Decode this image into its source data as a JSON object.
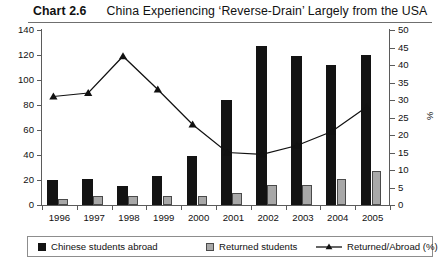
{
  "title": {
    "label": "Chart 2.6",
    "text": "China Experiencing ‘Reverse-Drain’ Largely from the USA"
  },
  "axes": {
    "y_left_ticks": [
      "0",
      "20",
      "40",
      "60",
      "80",
      "100",
      "120",
      "140"
    ],
    "y_right_ticks": [
      "0",
      "5",
      "10",
      "15",
      "20",
      "25",
      "30",
      "35",
      "40",
      "45",
      "50"
    ],
    "y_right_title": "%"
  },
  "legend": {
    "items": [
      {
        "label": "Chinese students abroad",
        "marker": "filled-square-dark",
        "color": "#131313"
      },
      {
        "label": "Returned students",
        "marker": "filled-square-grey",
        "color": "#a8a8a8"
      },
      {
        "label": "Returned/Abroad (%)",
        "marker": "line-with-triangle",
        "color": "#111111"
      }
    ]
  },
  "chart_data": {
    "type": "bar",
    "title": "China Experiencing ‘Reverse-Drain’ Largely from the USA",
    "xlabel": "",
    "ylabel": "",
    "y2label": "%",
    "ylim": [
      0,
      140
    ],
    "y2lim": [
      0,
      50
    ],
    "grid": false,
    "legend_position": "bottom",
    "categories": [
      "1996",
      "1997",
      "1998",
      "1999",
      "2000",
      "2001",
      "2002",
      "2003",
      "2004",
      "2005"
    ],
    "series": [
      {
        "name": "Chinese students abroad",
        "type": "bar",
        "axis": "left",
        "color": "#131313",
        "values": [
          20,
          21,
          15,
          23,
          39,
          84,
          127,
          119,
          112,
          120
        ]
      },
      {
        "name": "Returned students",
        "type": "bar",
        "axis": "left",
        "color": "#a8a8a8",
        "values": [
          5,
          7,
          7,
          7,
          7,
          10,
          16,
          16,
          21,
          27
        ]
      },
      {
        "name": "Returned/Abroad (%)",
        "type": "line",
        "axis": "right",
        "color": "#111111",
        "marker": "triangle",
        "values": [
          31,
          32,
          42.5,
          33,
          23,
          15,
          14.5,
          17,
          21,
          28
        ]
      }
    ]
  }
}
